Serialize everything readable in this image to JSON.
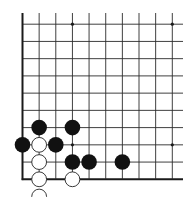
{
  "board": {
    "description": "Go board corner diagram (lower-left corner)",
    "columns": 10,
    "rows": 10,
    "colors": {
      "background": "#ffffff",
      "line": "#2a2a2a",
      "edge": "#1a1a1a",
      "black_stone": "#111111",
      "white_stone": "#ffffff",
      "white_stone_border": "#222222"
    },
    "star_points": [
      {
        "col": 3,
        "row": 0
      },
      {
        "col": 9,
        "row": 0
      },
      {
        "col": 3,
        "row": 6
      },
      {
        "col": 9,
        "row": 6
      }
    ],
    "stones": [
      {
        "color": "black",
        "col": 1,
        "row": 5
      },
      {
        "color": "black",
        "col": 3,
        "row": 5
      },
      {
        "color": "black",
        "col": 0,
        "row": 6
      },
      {
        "color": "white",
        "col": 1,
        "row": 6
      },
      {
        "color": "black",
        "col": 2,
        "row": 6
      },
      {
        "color": "white",
        "col": 1,
        "row": 7
      },
      {
        "color": "black",
        "col": 3,
        "row": 7
      },
      {
        "color": "black",
        "col": 4,
        "row": 7
      },
      {
        "color": "black",
        "col": 6,
        "row": 7
      },
      {
        "color": "white",
        "col": 1,
        "row": 8
      },
      {
        "color": "white",
        "col": 3,
        "row": 8
      },
      {
        "color": "white",
        "col": 1,
        "row": 9
      }
    ]
  }
}
